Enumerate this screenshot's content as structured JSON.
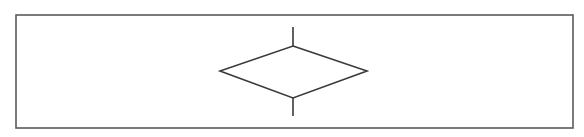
{
  "diagram": {
    "type": "flowchart-symbol",
    "symbol_name": "decision",
    "background_color": "#ffffff",
    "line_color": "#3a3a3a",
    "frame": {
      "x": 16,
      "y": 15,
      "width": 557,
      "height": 113,
      "stroke": "#5a5a5a",
      "stroke_width": 1.6
    },
    "decision_diamond": {
      "top": [
        293,
        46
      ],
      "right": [
        367,
        71
      ],
      "bottom": [
        293,
        98
      ],
      "left": [
        220,
        71
      ],
      "stroke_width": 1.6
    },
    "connectors": [
      {
        "name": "incoming-flow-line",
        "x1": 293,
        "y1": 27,
        "x2": 293,
        "y2": 46
      },
      {
        "name": "outgoing-flow-line",
        "x1": 293,
        "y1": 98,
        "x2": 293,
        "y2": 116
      }
    ],
    "labels": []
  }
}
